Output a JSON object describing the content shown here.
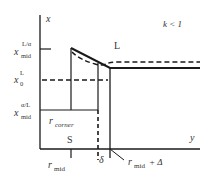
{
  "diagram": {
    "axes": {
      "vertical_label": "x",
      "horizontal_label": "y"
    },
    "condition": "k < 1",
    "regions": {
      "upper": "L",
      "lower": "S"
    },
    "y_axis_ticks": [
      {
        "base": "x",
        "sub": "mid",
        "sup": "L/α"
      },
      {
        "base": "x",
        "sub": "0",
        "sup": "L"
      },
      {
        "base": "x",
        "sub": "mid",
        "sup": "α/L"
      }
    ],
    "x_axis_ticks": [
      {
        "base": "r",
        "sub": "mid"
      },
      {
        "base": "δ"
      },
      {
        "base": "r",
        "sub": "mid",
        "suffix": " + Δ"
      }
    ],
    "inner_label": {
      "base": "r",
      "sub": "corner"
    },
    "colors": {
      "line": "#1a1a1a",
      "text": "#333333",
      "background": "#ffffff"
    }
  }
}
